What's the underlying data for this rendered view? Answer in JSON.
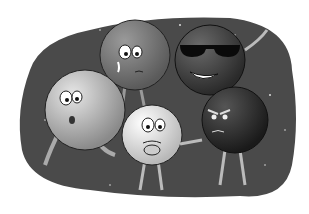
{
  "illustration": {
    "description": "Cartoon of five ball-shaped characters with faces, arms and legs against a dark starry background",
    "background_color": "#4a4a4a",
    "characters": [
      {
        "name": "crying-ball",
        "expression": "worried, tear",
        "shade": "#6e6e6e"
      },
      {
        "name": "sunglasses-ball",
        "expression": "grinning, waving",
        "shade": "#4f4f4f"
      },
      {
        "name": "surprised-ball",
        "expression": "surprised, walking",
        "shade": "#b5b5b5"
      },
      {
        "name": "scared-ball",
        "expression": "scared, biting nails",
        "shade": "#dcdcdc"
      },
      {
        "name": "angry-ball",
        "expression": "angry, pointing",
        "shade": "#2e2e2e"
      }
    ]
  }
}
